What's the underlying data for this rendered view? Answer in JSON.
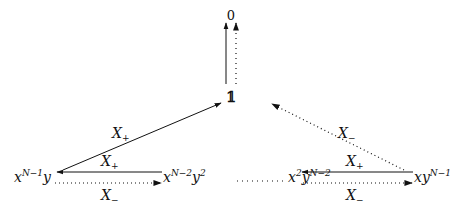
{
  "diagram": {
    "nodes": {
      "zero": {
        "label": "0"
      },
      "one": {
        "label": "𝟙"
      },
      "n1": {
        "base1": "x",
        "sup1": "N−1",
        "base2": "y",
        "sup2": ""
      },
      "n2": {
        "base1": "x",
        "sup1": "N−2",
        "base2": "y",
        "sup2": "2"
      },
      "n3": {
        "base1": "x",
        "sup1": "2",
        "base2": "y",
        "sup2": "N−2"
      },
      "n4": {
        "base1": "xy",
        "sup1": "N−1"
      }
    },
    "edges": {
      "diag_left": {
        "label_base": "X",
        "label_sub": "+",
        "style": "solid"
      },
      "diag_right": {
        "label_base": "X",
        "label_sub": "−",
        "style": "dotted"
      },
      "left_top": {
        "label_base": "X",
        "label_sub": "+",
        "style": "solid"
      },
      "left_bottom": {
        "label_base": "X",
        "label_sub": "−",
        "style": "dotted"
      },
      "right_top": {
        "label_base": "X",
        "label_sub": "+",
        "style": "solid"
      },
      "right_bottom": {
        "label_base": "X",
        "label_sub": "−",
        "style": "dotted"
      },
      "vertical_solid": {
        "style": "solid"
      },
      "vertical_dotted": {
        "style": "dotted"
      },
      "middle_ellipsis": {
        "style": "dotted"
      }
    },
    "colors": {
      "ink": "#111111",
      "background": "#ffffff"
    }
  }
}
